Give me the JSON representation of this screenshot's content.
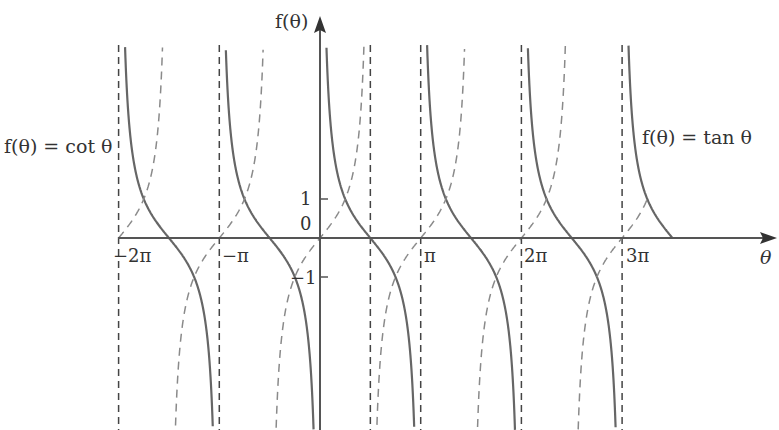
{
  "chart_data": {
    "type": "line",
    "title": "",
    "xlabel": "θ",
    "ylabel": "f(θ)",
    "xlim_pi": [
      -2,
      3.5
    ],
    "ylim": [
      -5,
      5
    ],
    "grid": false,
    "x_ticks": [
      {
        "value_pi": -2,
        "label": "−2π"
      },
      {
        "value_pi": -1,
        "label": "−π"
      },
      {
        "value_pi": 1,
        "label": "π"
      },
      {
        "value_pi": 2,
        "label": "2π"
      },
      {
        "value_pi": 3,
        "label": "3π"
      }
    ],
    "y_ticks": [
      {
        "value": 1,
        "label": "1"
      },
      {
        "value": 0,
        "label": "0"
      },
      {
        "value": -1,
        "label": "−1"
      }
    ],
    "series": [
      {
        "name": "f(θ) = cot θ",
        "function": "cot",
        "style": "solid",
        "color": "#666666",
        "domain_pi": [
          -2,
          3.5
        ]
      },
      {
        "name": "f(θ) = tan θ",
        "function": "tan",
        "style": "dashed",
        "color": "#8a8a8a",
        "domain_pi": [
          -2,
          3.25
        ]
      }
    ],
    "asymptotes_pi": [
      -2,
      -1,
      0.5,
      1,
      2,
      3
    ],
    "annotations": [
      {
        "text": "f(θ) = cot θ",
        "position": "left"
      },
      {
        "text": "f(θ) = tan θ",
        "position": "right"
      }
    ]
  },
  "labels": {
    "cot_label": "f(θ) = cot θ",
    "tan_label": "f(θ) = tan θ",
    "y_axis": "f(θ)",
    "x_axis": "θ",
    "tick_neg2pi": "−2π",
    "tick_negpi": "−π",
    "tick_pi": "π",
    "tick_2pi": "2π",
    "tick_3pi": "3π",
    "tick_1": "1",
    "tick_0": "0",
    "tick_neg1": "−1"
  }
}
